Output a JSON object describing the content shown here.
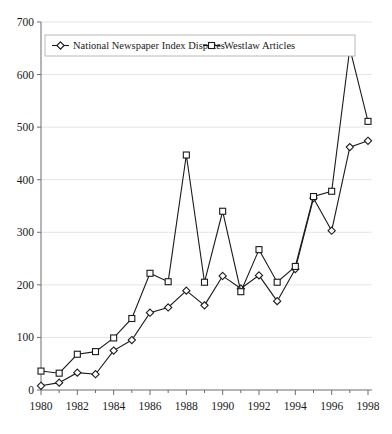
{
  "chart_data": {
    "type": "line",
    "title": "",
    "subtitle": "",
    "xlabel": "",
    "ylabel": "",
    "xlim": [
      1980,
      1998
    ],
    "ylim": [
      0,
      700
    ],
    "yticks": [
      0,
      100,
      200,
      300,
      400,
      500,
      600,
      700
    ],
    "xticks": [
      1980,
      1982,
      1984,
      1986,
      1988,
      1990,
      1992,
      1994,
      1996,
      1998
    ],
    "grid": true,
    "legend_position": "top-center",
    "x": [
      1980,
      1981,
      1982,
      1983,
      1984,
      1985,
      1986,
      1987,
      1988,
      1989,
      1990,
      1991,
      1992,
      1993,
      1994,
      1995,
      1996,
      1997,
      1998
    ],
    "series": [
      {
        "name": "National Newspaper Index Disputes",
        "marker": "diamond",
        "color": "#1a1a1a",
        "values": [
          8,
          14,
          33,
          30,
          75,
          95,
          147,
          157,
          189,
          161,
          217,
          193,
          218,
          169,
          230,
          365,
          303,
          462,
          474
        ]
      },
      {
        "name": "Westlaw Articles",
        "marker": "square",
        "color": "#1a1a1a",
        "values": [
          36,
          32,
          68,
          73,
          99,
          136,
          222,
          206,
          447,
          205,
          340,
          187,
          267,
          205,
          235,
          368,
          378,
          650,
          511
        ]
      }
    ]
  },
  "legend": {
    "items": [
      {
        "label": "National Newspaper Index Disputes",
        "marker": "diamond"
      },
      {
        "label": "Westlaw Articles",
        "marker": "square"
      }
    ]
  },
  "axis": {
    "y_labels": [
      "700",
      "600",
      "500",
      "400",
      "300",
      "200",
      "100",
      "0"
    ],
    "x_labels": [
      "1980",
      "1982",
      "1984",
      "1986",
      "1988",
      "1990",
      "1992",
      "1994",
      "1996",
      "1998"
    ]
  },
  "colors": {
    "ink": "#1a1a1a",
    "axis": "#6d6d6d",
    "grid": "#d8d8d8",
    "background": "#ffffff"
  }
}
